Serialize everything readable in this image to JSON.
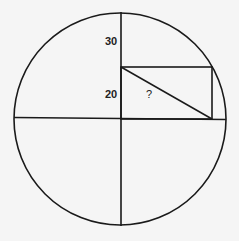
{
  "diagram": {
    "labels": {
      "top": "30",
      "middle": "20",
      "hypotenuse": "?"
    },
    "colors": {
      "stroke": "#1a1a1a",
      "background": "#f5f5f5"
    }
  }
}
